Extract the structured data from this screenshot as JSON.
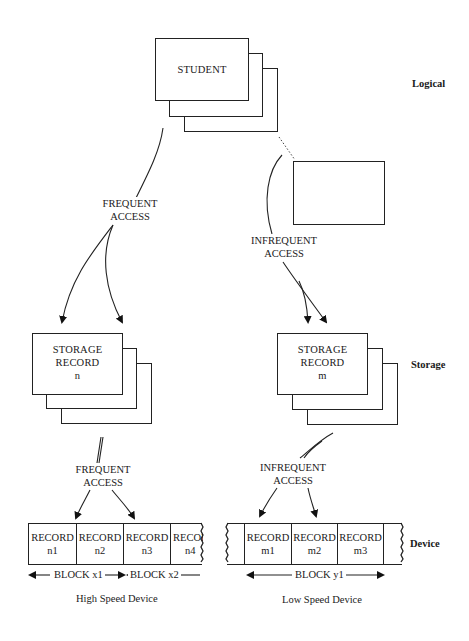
{
  "levels": {
    "logical": "Logical",
    "storage": "Storage",
    "device": "Device"
  },
  "logical": {
    "entity_label": "STUDENT"
  },
  "access": {
    "left_upper": [
      "FREQUENT",
      "ACCESS"
    ],
    "right_upper": [
      "INFREQUENT",
      "ACCESS"
    ],
    "left_lower": [
      "FREQUENT",
      "ACCESS"
    ],
    "right_lower": [
      "INFREQUENT",
      "ACCESS"
    ]
  },
  "storage_records": [
    {
      "line1": "STORAGE",
      "line2": "RECORD",
      "id": "n"
    },
    {
      "line1": "STORAGE",
      "line2": "RECORD",
      "id": "m"
    }
  ],
  "high_speed_device": {
    "records": [
      {
        "label": "RECORD",
        "id": "n1"
      },
      {
        "label": "RECORD",
        "id": "n2"
      },
      {
        "label": "RECORD",
        "id": "n3"
      },
      {
        "label": "RECORD",
        "id": "n4"
      }
    ],
    "blocks": [
      "BLOCK x1",
      "BLOCK x2"
    ],
    "caption": "High Speed Device"
  },
  "low_speed_device": {
    "records": [
      {
        "label": "RECORD",
        "id": "m1"
      },
      {
        "label": "RECORD",
        "id": "m2"
      },
      {
        "label": "RECORD",
        "id": "m3"
      }
    ],
    "blocks": [
      "BLOCK y1"
    ],
    "caption": "Low Speed Device"
  }
}
